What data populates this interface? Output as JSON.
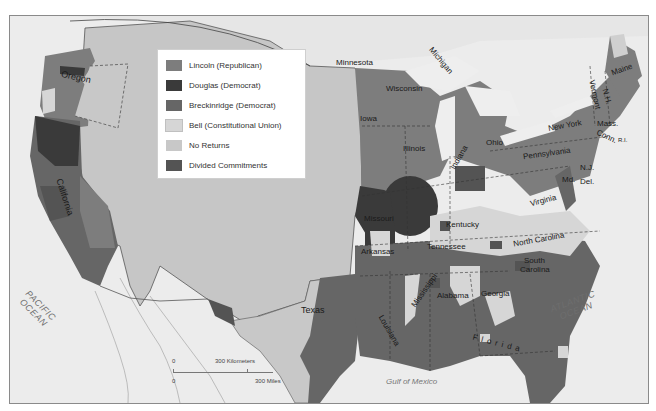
{
  "map": {
    "subject": "1860 U.S. presidential election results by county",
    "colors": {
      "lincoln": "#7d7d7d",
      "douglas": "#3a3a3a",
      "breckinridge": "#666666",
      "bell": "#d9d9d9",
      "no_returns": "#c4c4c4",
      "divided": "#545454",
      "background": "#e9e9e9",
      "water": "#f0f0f0"
    }
  },
  "legend": {
    "items": [
      {
        "label": "Lincoln (Republican)",
        "color": "#7d7d7d"
      },
      {
        "label": "Douglas (Democrat)",
        "color": "#3a3a3a"
      },
      {
        "label": " Breckinridge (Democrat)",
        "color": "#666666"
      },
      {
        "label": "Bell (Constitutional Union)",
        "color": "#d6d6d6"
      },
      {
        "label": "No Returns",
        "color": "#c8c8c8"
      },
      {
        "label": "Divided Commitments",
        "color": "#545454"
      }
    ]
  },
  "labels": {
    "states": {
      "oregon": "Oregon",
      "california": "California",
      "minnesota": "Minnesota",
      "wisconsin": "Wisconsin",
      "michigan": "Michigan",
      "iowa": "Iowa",
      "illinois": "Illinois",
      "indiana": "Indiana",
      "ohio": "Ohio",
      "missouri": "Missouri",
      "kentucky": "Kentucky",
      "tennessee": "Tennessee",
      "arkansas": "Arkansas",
      "texas": "Texas",
      "louisiana": "Louisiana",
      "mississippi": "Mississippi",
      "alabama": "Alabama",
      "georgia": "Georgia",
      "florida": "Florida",
      "south_carolina_1": "South",
      "south_carolina_2": "Carolina",
      "north_carolina": "North Carolina",
      "virginia": "Virginia",
      "pennsylvania": "Pennsylvania",
      "new_york": "New York",
      "maine": "Maine",
      "vermont": "Vermont",
      "nh": "N.H.",
      "mass": "Mass.",
      "conn": "Conn.",
      "ri": "R.I.",
      "nj": "N.J.",
      "md": "Md.",
      "del": "Del."
    },
    "water": {
      "pacific_1": "PACIFIC",
      "pacific_2": "OCEAN",
      "atlantic_1": "ATLANTIC",
      "atlantic_2": "OCEAN",
      "gulf": "Gulf of Mexico"
    }
  },
  "scale_bar": {
    "zero_top": "0",
    "km_label": "300 Kilometers",
    "zero_bottom": "0",
    "mi_label": "300 Miles"
  }
}
